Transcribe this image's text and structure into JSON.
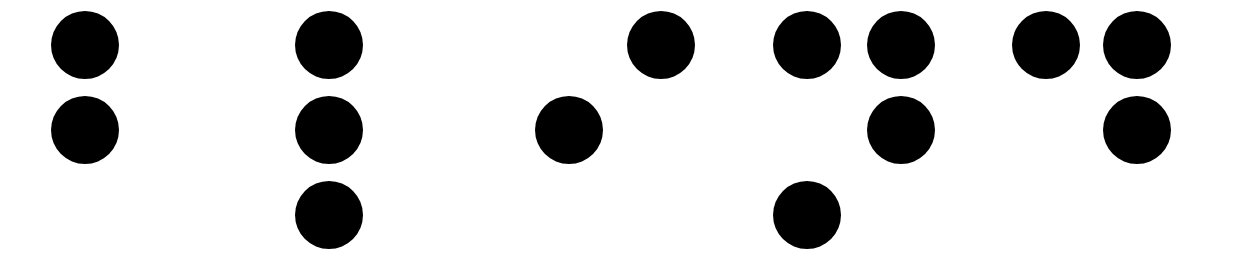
{
  "canvas": {
    "width": 1238,
    "height": 268,
    "background_color": "#ffffff",
    "dot_color": "#000000",
    "dot_diameter": 68,
    "row_centers": [
      45,
      130,
      215
    ],
    "description": "black-filled-circles-on-white"
  },
  "grid": {
    "rows": 3,
    "columns_per_cell": 2,
    "dot_numbering": "1,2,3 left column top-to-bottom; 4,5,6 right column top-to-bottom"
  },
  "cells": [
    {
      "index": 1,
      "name": "braille-cell-1",
      "left_column_x": 85,
      "right_column_x": 177,
      "dots": [
        {
          "number": 1,
          "col": 0,
          "row": 0,
          "on": true
        },
        {
          "number": 2,
          "col": 0,
          "row": 1,
          "on": true
        },
        {
          "number": 3,
          "col": 0,
          "row": 2,
          "on": false
        },
        {
          "number": 4,
          "col": 1,
          "row": 0,
          "on": false
        },
        {
          "number": 5,
          "col": 1,
          "row": 1,
          "on": false
        },
        {
          "number": 6,
          "col": 1,
          "row": 2,
          "on": false
        }
      ]
    },
    {
      "index": 2,
      "name": "braille-cell-2",
      "left_column_x": 329,
      "right_column_x": 421,
      "dots": [
        {
          "number": 1,
          "col": 0,
          "row": 0,
          "on": true
        },
        {
          "number": 2,
          "col": 0,
          "row": 1,
          "on": true
        },
        {
          "number": 3,
          "col": 0,
          "row": 2,
          "on": true
        },
        {
          "number": 4,
          "col": 1,
          "row": 0,
          "on": false
        },
        {
          "number": 5,
          "col": 1,
          "row": 1,
          "on": false
        },
        {
          "number": 6,
          "col": 1,
          "row": 2,
          "on": false
        }
      ]
    },
    {
      "index": 3,
      "name": "braille-cell-3",
      "left_column_x": 569,
      "right_column_x": 661,
      "dots": [
        {
          "number": 1,
          "col": 0,
          "row": 0,
          "on": false
        },
        {
          "number": 2,
          "col": 0,
          "row": 1,
          "on": true
        },
        {
          "number": 3,
          "col": 0,
          "row": 2,
          "on": false
        },
        {
          "number": 4,
          "col": 1,
          "row": 0,
          "on": true
        },
        {
          "number": 5,
          "col": 1,
          "row": 1,
          "on": false
        },
        {
          "number": 6,
          "col": 1,
          "row": 2,
          "on": false
        }
      ]
    },
    {
      "index": 4,
      "name": "braille-cell-4",
      "left_column_x": 807,
      "right_column_x": 901,
      "dots": [
        {
          "number": 1,
          "col": 0,
          "row": 0,
          "on": true
        },
        {
          "number": 2,
          "col": 0,
          "row": 1,
          "on": false
        },
        {
          "number": 3,
          "col": 0,
          "row": 2,
          "on": true
        },
        {
          "number": 4,
          "col": 1,
          "row": 0,
          "on": true
        },
        {
          "number": 5,
          "col": 1,
          "row": 1,
          "on": true
        },
        {
          "number": 6,
          "col": 1,
          "row": 2,
          "on": false
        }
      ]
    },
    {
      "index": 5,
      "name": "braille-cell-5",
      "left_column_x": 1046,
      "right_column_x": 1137,
      "dots": [
        {
          "number": 1,
          "col": 0,
          "row": 0,
          "on": true
        },
        {
          "number": 2,
          "col": 0,
          "row": 1,
          "on": false
        },
        {
          "number": 3,
          "col": 0,
          "row": 2,
          "on": false
        },
        {
          "number": 4,
          "col": 1,
          "row": 0,
          "on": true
        },
        {
          "number": 5,
          "col": 1,
          "row": 1,
          "on": true
        },
        {
          "number": 6,
          "col": 1,
          "row": 2,
          "on": false
        }
      ]
    }
  ],
  "dot_count_total": 13
}
